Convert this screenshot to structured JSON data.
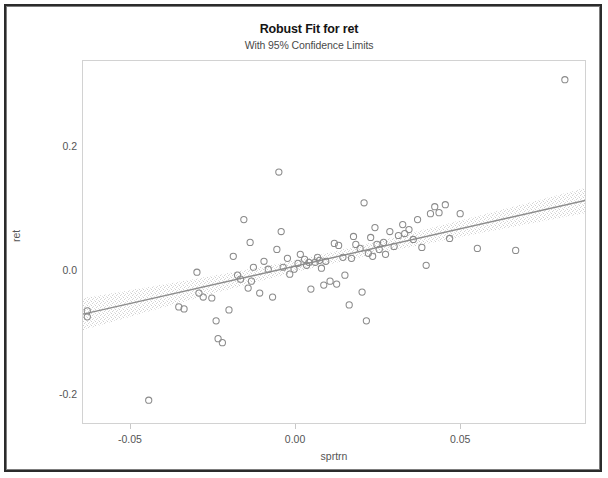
{
  "window": {
    "border_color": "#2b2b2b"
  },
  "chart_data": {
    "type": "scatter",
    "title": "Robust Fit for ret",
    "subtitle": "With 95% Confidence Limits",
    "xlabel": "sprtrn",
    "ylabel": "ret",
    "xlim": [
      -0.0645,
      0.0881
    ],
    "ylim": [
      -0.248,
      0.339
    ],
    "xticks": [
      -0.05,
      0.0,
      0.05
    ],
    "xtick_labels": [
      "-0.05",
      "0.00",
      "0.05"
    ],
    "yticks": [
      0.2,
      0.0,
      -0.2
    ],
    "ytick_labels": [
      "0.2",
      "0.0",
      "-0.2"
    ],
    "grid": false,
    "legend": null,
    "marker_style": "open-circle",
    "marker_color": "#8a8a8a",
    "line_color": "#8c8c8c",
    "band_color": "#d9d9d9",
    "fit": {
      "kind": "robust-linear",
      "intercept": 0.0085,
      "slope": 1.205,
      "x_start": -0.0645,
      "x_end": 0.0881,
      "y_start": -0.0692,
      "y_end": 0.1147
    },
    "confidence_band": {
      "level": 0.95,
      "half_width_at_x_start": 0.0258,
      "half_width_at_x_center": 0.0095,
      "half_width_at_x_end": 0.0205,
      "center_x": 0.0075
    },
    "points": [
      {
        "x": -0.0632,
        "y": -0.064
      },
      {
        "x": -0.0632,
        "y": -0.0736
      },
      {
        "x": -0.0446,
        "y": -0.208
      },
      {
        "x": -0.0355,
        "y": -0.0576
      },
      {
        "x": -0.0339,
        "y": -0.0608
      },
      {
        "x": -0.03,
        "y": -0.0016
      },
      {
        "x": -0.0294,
        "y": -0.0352
      },
      {
        "x": -0.0281,
        "y": -0.0416
      },
      {
        "x": -0.0255,
        "y": -0.0432
      },
      {
        "x": -0.0242,
        "y": -0.08
      },
      {
        "x": -0.0236,
        "y": -0.1088
      },
      {
        "x": -0.0223,
        "y": -0.1152
      },
      {
        "x": -0.0203,
        "y": -0.0624
      },
      {
        "x": -0.019,
        "y": 0.024
      },
      {
        "x": -0.0177,
        "y": -0.0064
      },
      {
        "x": -0.0168,
        "y": -0.0128
      },
      {
        "x": -0.0158,
        "y": 0.0832
      },
      {
        "x": -0.0145,
        "y": -0.0272
      },
      {
        "x": -0.0139,
        "y": 0.0464
      },
      {
        "x": -0.0135,
        "y": -0.016
      },
      {
        "x": -0.0129,
        "y": 0.0064
      },
      {
        "x": -0.011,
        "y": -0.0352
      },
      {
        "x": -0.0097,
        "y": 0.016
      },
      {
        "x": -0.0084,
        "y": 0.0032
      },
      {
        "x": -0.0071,
        "y": -0.0416
      },
      {
        "x": -0.0058,
        "y": 0.0352
      },
      {
        "x": -0.0052,
        "y": 0.16
      },
      {
        "x": -0.0045,
        "y": 0.064
      },
      {
        "x": -0.0039,
        "y": 0.0064
      },
      {
        "x": -0.0026,
        "y": 0.0208
      },
      {
        "x": -0.0019,
        "y": -0.0048
      },
      {
        "x": -0.0006,
        "y": 0.0032
      },
      {
        "x": 0.0006,
        "y": 0.0128
      },
      {
        "x": 0.0013,
        "y": 0.0272
      },
      {
        "x": 0.0026,
        "y": 0.0192
      },
      {
        "x": 0.0032,
        "y": 0.0096
      },
      {
        "x": 0.0039,
        "y": 0.0144
      },
      {
        "x": 0.0045,
        "y": -0.0288
      },
      {
        "x": 0.0058,
        "y": 0.0144
      },
      {
        "x": 0.0065,
        "y": 0.0224
      },
      {
        "x": 0.0071,
        "y": 0.0176
      },
      {
        "x": 0.0077,
        "y": 0.0048
      },
      {
        "x": 0.0084,
        "y": -0.0224
      },
      {
        "x": 0.009,
        "y": 0.016
      },
      {
        "x": 0.0103,
        "y": -0.016
      },
      {
        "x": 0.0116,
        "y": 0.0448
      },
      {
        "x": 0.0123,
        "y": -0.0208
      },
      {
        "x": 0.0129,
        "y": 0.0416
      },
      {
        "x": 0.0142,
        "y": 0.0224
      },
      {
        "x": 0.0148,
        "y": -0.0064
      },
      {
        "x": 0.0161,
        "y": -0.0544
      },
      {
        "x": 0.0168,
        "y": 0.0208
      },
      {
        "x": 0.0174,
        "y": 0.056
      },
      {
        "x": 0.0181,
        "y": 0.0432
      },
      {
        "x": 0.0194,
        "y": 0.0368
      },
      {
        "x": 0.02,
        "y": -0.0336
      },
      {
        "x": 0.0206,
        "y": 0.1104
      },
      {
        "x": 0.0213,
        "y": -0.08
      },
      {
        "x": 0.0219,
        "y": 0.0288
      },
      {
        "x": 0.0226,
        "y": 0.0544
      },
      {
        "x": 0.0232,
        "y": 0.024
      },
      {
        "x": 0.0239,
        "y": 0.0704
      },
      {
        "x": 0.0245,
        "y": 0.0432
      },
      {
        "x": 0.0252,
        "y": 0.0352
      },
      {
        "x": 0.0265,
        "y": 0.0464
      },
      {
        "x": 0.0271,
        "y": 0.0272
      },
      {
        "x": 0.0284,
        "y": 0.064
      },
      {
        "x": 0.0297,
        "y": 0.04
      },
      {
        "x": 0.031,
        "y": 0.0576
      },
      {
        "x": 0.0323,
        "y": 0.0752
      },
      {
        "x": 0.0329,
        "y": 0.0608
      },
      {
        "x": 0.0342,
        "y": 0.0672
      },
      {
        "x": 0.0355,
        "y": 0.0512
      },
      {
        "x": 0.0368,
        "y": 0.0832
      },
      {
        "x": 0.0381,
        "y": 0.0384
      },
      {
        "x": 0.0394,
        "y": 0.0096
      },
      {
        "x": 0.0407,
        "y": 0.0928
      },
      {
        "x": 0.042,
        "y": 0.104
      },
      {
        "x": 0.0433,
        "y": 0.0944
      },
      {
        "x": 0.0452,
        "y": 0.1072
      },
      {
        "x": 0.0465,
        "y": 0.0528
      },
      {
        "x": 0.0497,
        "y": 0.0928
      },
      {
        "x": 0.0549,
        "y": 0.0368
      },
      {
        "x": 0.0665,
        "y": 0.0336
      },
      {
        "x": 0.0814,
        "y": 0.3088
      }
    ]
  },
  "axes": {
    "y_label": "ret",
    "x_label": "sprtrn"
  }
}
